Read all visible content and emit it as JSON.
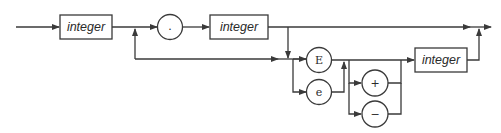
{
  "diagram": {
    "type": "railroad-syntax-diagram",
    "nonterminals": [
      {
        "id": "int1",
        "label": "integer"
      },
      {
        "id": "int2",
        "label": "integer"
      },
      {
        "id": "int3",
        "label": "integer"
      }
    ],
    "terminals": [
      {
        "id": "dot",
        "label": "."
      },
      {
        "id": "E",
        "label": "E"
      },
      {
        "id": "e",
        "label": "e"
      },
      {
        "id": "plus",
        "label": "+"
      },
      {
        "id": "minus",
        "label": "−"
      }
    ],
    "colors": {
      "line": "#3a3a3a",
      "background": "#ffffff"
    }
  }
}
